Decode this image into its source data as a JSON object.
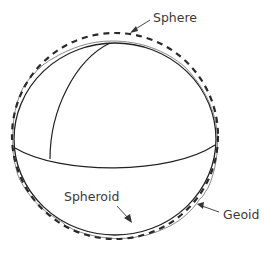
{
  "labels": {
    "sphere": "Sphere",
    "spheroid": "Spheroid",
    "geoid": "Geoid"
  },
  "colors": {
    "background": "#ffffff",
    "outline": "#222222",
    "geoid": "#8a8a8a",
    "sphere_dash": "#2a2a2a",
    "text": "#3a3a3a"
  }
}
